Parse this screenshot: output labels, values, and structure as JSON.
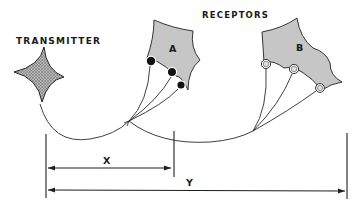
{
  "diagram": {
    "labels": {
      "transmitter": "TRANSMITTER",
      "receptors": "RECEPTORS",
      "receptor_a": "A",
      "receptor_b": "B",
      "distance_x": "X",
      "distance_y": "Y"
    },
    "nodes": [
      {
        "id": "transmitter",
        "label": "TRANSMITTER",
        "shape": "four-point star",
        "fill": "crosshatch grey"
      },
      {
        "id": "receptor_a",
        "label": "A",
        "shape": "concave polygon",
        "fill": "#c8c8c8",
        "terminals": 3,
        "terminal_style": "filled black"
      },
      {
        "id": "receptor_b",
        "label": "B",
        "shape": "concave polygon",
        "fill": "#c8c8c8",
        "terminals": 3,
        "terminal_style": "hollow"
      }
    ],
    "edges": [
      {
        "from": "transmitter",
        "to": "receptor_a",
        "branches": 3
      },
      {
        "from": "transmitter",
        "to": "receptor_b",
        "branches": 3
      }
    ],
    "dimensions": [
      {
        "label": "X",
        "from": "transmitter",
        "to": "receptor_a"
      },
      {
        "label": "Y",
        "from": "transmitter",
        "to": "receptor_b"
      }
    ],
    "colors": {
      "ink": "#1a1a1a",
      "receptor_fill": "#c8c8c8",
      "background": "#ffffff"
    }
  }
}
